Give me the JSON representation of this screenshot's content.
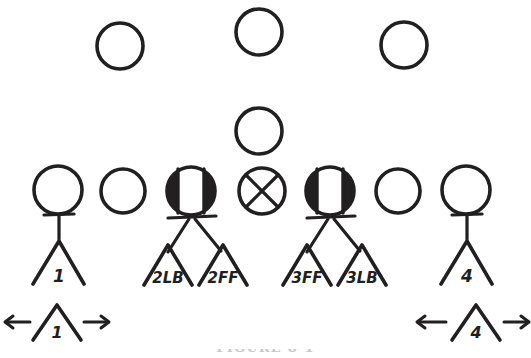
{
  "figure": {
    "kind": "hand-drawn-football-formation-diagram",
    "ink_color": "#211f20",
    "background_color": "#ffffff",
    "caption": "FIGURE 8-1"
  },
  "back_row": {
    "label": "defensive-backs-row",
    "players": [
      {
        "id": "back-left",
        "symbol": "open-circle",
        "cx": 120,
        "cy": 46,
        "r": 23
      },
      {
        "id": "back-center",
        "symbol": "open-circle",
        "cx": 259,
        "cy": 32,
        "r": 23
      },
      {
        "id": "back-right",
        "symbol": "open-circle",
        "cx": 404,
        "cy": 45,
        "r": 23
      }
    ]
  },
  "mid_row": {
    "label": "middle-backer-row",
    "players": [
      {
        "id": "mid-center",
        "symbol": "open-circle",
        "cx": 259,
        "cy": 131,
        "r": 23
      }
    ]
  },
  "line_row": {
    "label": "offensive-line-row",
    "players": [
      {
        "id": "line-1",
        "symbol": "open-circle",
        "cx": 58,
        "cy": 190,
        "r": 24
      },
      {
        "id": "line-2",
        "symbol": "open-circle",
        "cx": 123,
        "cy": 191,
        "r": 22
      },
      {
        "id": "line-3",
        "symbol": "half-filled-circle",
        "cx": 191,
        "cy": 191,
        "r": 24
      },
      {
        "id": "line-4",
        "symbol": "x-circle",
        "cx": 262,
        "cy": 191,
        "r": 23
      },
      {
        "id": "line-5",
        "symbol": "half-filled-circle",
        "cx": 330,
        "cy": 191,
        "r": 24
      },
      {
        "id": "line-6",
        "symbol": "open-circle",
        "cx": 398,
        "cy": 191,
        "r": 22
      },
      {
        "id": "line-7",
        "symbol": "open-circle",
        "cx": 466,
        "cy": 190,
        "r": 24
      }
    ]
  },
  "defenders": [
    {
      "id": "defender-1",
      "label": "1",
      "alignment": "left-end",
      "stem": "single-t-stem",
      "chevrons": [
        "1"
      ]
    },
    {
      "id": "defender-2",
      "label": "2",
      "alignment": "left-inside",
      "stem": "split-two-legs",
      "chevrons": [
        "2LB",
        "2FF"
      ]
    },
    {
      "id": "defender-3",
      "label": "3",
      "alignment": "right-inside",
      "stem": "split-two-legs",
      "chevrons": [
        "3FF",
        "3LB"
      ]
    },
    {
      "id": "defender-4",
      "label": "4",
      "alignment": "right-end",
      "stem": "single-t-stem",
      "chevrons": [
        "4"
      ]
    }
  ],
  "chevron_labels": {
    "left_single": "1",
    "left_inside_a": "2LB",
    "left_inside_b": "2FF",
    "right_inside_a": "3FF",
    "right_inside_b": "3LB",
    "right_single": "4"
  },
  "movement_row": {
    "label": "containment-movement-row",
    "items": [
      {
        "id": "move-left",
        "chevron_label": "1",
        "arrow_left": "←",
        "arrow_right": "→",
        "direction": "bidirectional"
      },
      {
        "id": "move-right",
        "chevron_label": "4",
        "arrow_left": "←",
        "arrow_right": "→",
        "direction": "bidirectional"
      }
    ]
  }
}
